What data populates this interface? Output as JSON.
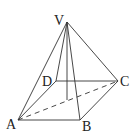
{
  "diagram": {
    "type": "square-based pyramid",
    "vertices": {
      "apex": "V",
      "base": [
        "A",
        "B",
        "C",
        "D"
      ]
    },
    "labels": {
      "V": "V",
      "A": "A",
      "B": "B",
      "C": "C",
      "D": "D"
    },
    "edges": [
      {
        "from": "V",
        "to": "A",
        "style": "solid"
      },
      {
        "from": "V",
        "to": "B",
        "style": "solid"
      },
      {
        "from": "V",
        "to": "C",
        "style": "solid"
      },
      {
        "from": "V",
        "to": "D",
        "style": "solid"
      },
      {
        "from": "A",
        "to": "B",
        "style": "solid"
      },
      {
        "from": "B",
        "to": "C",
        "style": "solid"
      },
      {
        "from": "C",
        "to": "D",
        "style": "solid"
      },
      {
        "from": "D",
        "to": "A",
        "style": "solid"
      },
      {
        "from": "A",
        "to": "C",
        "style": "dashed"
      }
    ],
    "altitude": {
      "from": "V",
      "to": "base-center",
      "style": "solid"
    }
  }
}
